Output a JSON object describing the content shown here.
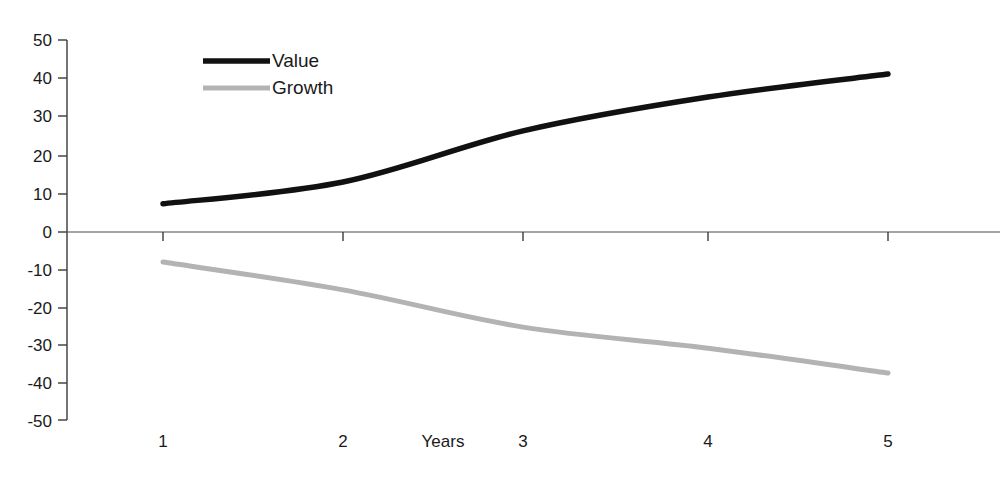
{
  "chart_data": {
    "type": "line",
    "title": "",
    "xlabel": "Years",
    "ylabel": "",
    "x": [
      1,
      2,
      3,
      4,
      5
    ],
    "categories": [
      "1",
      "2",
      "3",
      "4",
      "5"
    ],
    "ylim": [
      -50,
      50
    ],
    "xlim": [
      0.3,
      5.7
    ],
    "y_ticks": [
      50,
      40,
      30,
      20,
      10,
      0,
      -10,
      -20,
      -30,
      -40,
      -50
    ],
    "y_tick_labels": [
      "50",
      "40",
      "30",
      "20",
      "10",
      "0",
      "-10",
      "-20",
      "-30",
      "-40",
      "-50"
    ],
    "x_tick_labels": [
      "1",
      "2",
      "3",
      "4",
      "5"
    ],
    "grid": false,
    "legend_position": "top-left-inside",
    "smoothing": "spline",
    "markers": false,
    "background": "#ffffff",
    "series": [
      {
        "name": "Value",
        "color": "#111111",
        "line_width": 5.5,
        "values": [
          7.5,
          13.3,
          26.9,
          35.9,
          42.0
        ]
      },
      {
        "name": "Growth",
        "color": "#b3b3b3",
        "line_width": 5.0,
        "values": [
          -8.0,
          -15.4,
          -25.3,
          -30.9,
          -37.5
        ]
      }
    ]
  },
  "legend": {
    "entries": [
      {
        "label": "Value",
        "color": "#111111"
      },
      {
        "label": "Growth",
        "color": "#b3b3b3"
      }
    ]
  },
  "axes": {
    "x_title": "Years",
    "y_tick_0": "50",
    "y_tick_1": "40",
    "y_tick_2": "30",
    "y_tick_3": "20",
    "y_tick_4": "10",
    "y_tick_5": "0",
    "y_tick_6": "-10",
    "y_tick_7": "-20",
    "y_tick_8": "-30",
    "y_tick_9": "-40",
    "y_tick_10": "-50",
    "x_tick_0": "1",
    "x_tick_1": "2",
    "x_tick_2": "3",
    "x_tick_3": "4",
    "x_tick_4": "5"
  }
}
